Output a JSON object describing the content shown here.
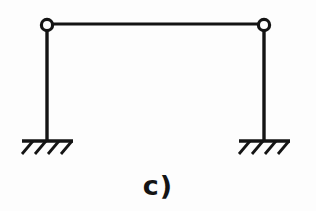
{
  "figure": {
    "caption": "c)",
    "type": "structural-engineering-diagram",
    "background_color": "#fdfdfd",
    "line_color": "#141414",
    "geometry": {
      "beam": {
        "label": "horizontal-beam",
        "x1": 47,
        "y1": 24,
        "x2": 264,
        "y2": 24,
        "stroke_width": 3.2
      },
      "columns": [
        {
          "label": "left-column",
          "x1": 47,
          "y1": 25,
          "x2": 47,
          "y2": 141,
          "stroke_width": 3.4
        },
        {
          "label": "right-column",
          "x1": 264,
          "y1": 25,
          "x2": 264,
          "y2": 141,
          "stroke_width": 3.4
        }
      ],
      "hinges": [
        {
          "label": "left-hinge",
          "cx": 47,
          "cy": 25,
          "r": 5.6,
          "stroke_width": 3.2,
          "fill": "none"
        },
        {
          "label": "right-hinge",
          "cx": 264,
          "cy": 25,
          "r": 5.6,
          "stroke_width": 3.2,
          "fill": "none"
        }
      ],
      "supports": [
        {
          "label": "left-fixed-support",
          "ground_x1": 22,
          "ground_x2": 73,
          "ground_y": 141,
          "stroke_width": 3.4,
          "hatch_count": 4,
          "hatch_dx": -11,
          "hatch_dy": 13,
          "hatch_stroke_width": 2.8,
          "hatch_start_x": [
            33,
            46,
            59,
            72
          ]
        },
        {
          "label": "right-fixed-support",
          "ground_x1": 239,
          "ground_x2": 290,
          "ground_y": 141,
          "stroke_width": 3.4,
          "hatch_count": 4,
          "hatch_dx": -11,
          "hatch_dy": 13,
          "hatch_stroke_width": 2.8,
          "hatch_start_x": [
            250,
            263,
            276,
            289
          ]
        }
      ]
    }
  }
}
